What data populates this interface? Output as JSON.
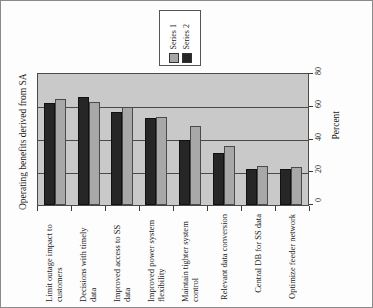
{
  "chart_data": {
    "type": "bar",
    "title": "",
    "ylabel": "Operating benefits derived from SA",
    "xlabel": "",
    "secondary_axis_label": "Percent",
    "ylim": [
      0,
      80
    ],
    "yticks": [
      0,
      20,
      40,
      60,
      80
    ],
    "grid": true,
    "orientation": "rotated-90",
    "legend_position": "top-center",
    "categories": [
      "Limit outage impact to customers",
      "Decisions with timely data",
      "Improved access to SS data",
      "Improved power system flexibility",
      "Maintain tighter system control",
      "Relevant data conversion",
      "Central DB for SS data",
      "Optimize feeder network"
    ],
    "series": [
      {
        "name": "Series 2",
        "color": "#262626",
        "values": [
          62,
          66,
          57,
          53,
          40,
          32,
          22,
          22
        ]
      },
      {
        "name": "Series 1",
        "color": "#a8a8a8",
        "values": [
          65,
          63,
          60,
          54,
          48,
          36,
          24,
          23
        ]
      }
    ]
  },
  "legend": {
    "entries": [
      {
        "label": "Series 2",
        "swatch": "#262626"
      },
      {
        "label": "Series 1",
        "swatch": "#a8a8a8"
      }
    ]
  },
  "axes": {
    "y_title": "Operating benefits derived from SA",
    "percent_label": "Percent",
    "tick_labels": [
      "0",
      "20",
      "40",
      "60",
      "80"
    ]
  },
  "colors": {
    "plot_background": "#c9c9c9",
    "series2": "#262626",
    "series1": "#a8a8a8",
    "axis": "#3a3a3a",
    "frame": "#8a8a8a"
  }
}
